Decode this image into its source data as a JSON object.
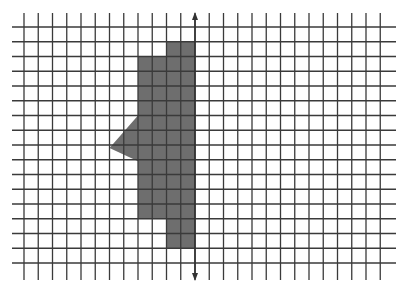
{
  "figure": {
    "width": 404,
    "height": 289,
    "colors": {
      "background": "#ffffff",
      "grid": "#3a3a3a",
      "shape": "#6e6e6e",
      "axis": "#333333"
    },
    "grid": {
      "x0": 24,
      "dx": 14.25,
      "cols": 25,
      "y0": 27,
      "dy": 14.75,
      "rows": 16,
      "h_line_x_start": 12,
      "h_line_x_end": 396,
      "v_line_y_start": 13,
      "v_line_y_end": 280
    },
    "axis": {
      "column_index": 12,
      "y_top": 12,
      "y_bottom": 281
    },
    "shape": {
      "vertices_grid": [
        [
          10,
          1
        ],
        [
          12,
          1
        ],
        [
          12,
          15
        ],
        [
          10,
          15
        ],
        [
          10,
          13
        ],
        [
          8,
          13
        ],
        [
          8,
          9.1
        ],
        [
          6,
          8.2
        ],
        [
          8,
          6
        ],
        [
          8,
          2
        ],
        [
          10,
          2
        ]
      ]
    }
  }
}
